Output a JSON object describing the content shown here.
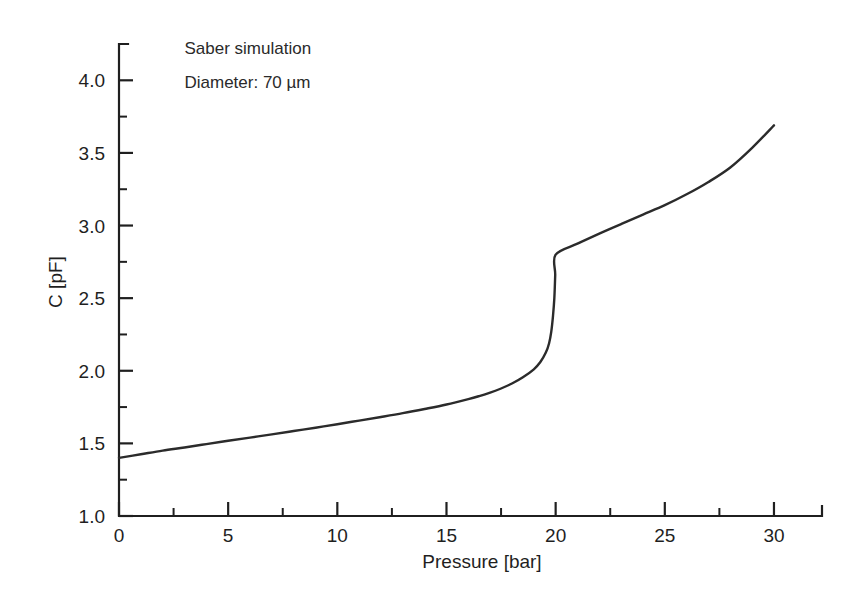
{
  "chart_data": {
    "type": "line",
    "title": "",
    "xlabel": "Pressure [bar]",
    "ylabel": "C [pF]",
    "xlim": [
      0,
      32.2
    ],
    "ylim": [
      1.0,
      4.25
    ],
    "grid": false,
    "legend": null,
    "annotations": [
      {
        "text": "Saber simulation",
        "x": 3.0,
        "y": 4.18
      },
      {
        "text": "Diameter: 70 µm",
        "x": 3.0,
        "y": 3.95
      }
    ],
    "xticks": [
      0,
      5,
      10,
      15,
      20,
      25,
      30
    ],
    "xtick_labels": [
      "0",
      "5",
      "10",
      "15",
      "20",
      "25",
      "30"
    ],
    "xticks_minor": [
      2.5,
      7.5,
      12.5,
      17.5,
      22.5,
      27.5
    ],
    "yticks": [
      1.0,
      1.5,
      2.0,
      2.5,
      3.0,
      3.5,
      4.0
    ],
    "ytick_labels": [
      "1.0",
      "1.5",
      "2.0",
      "2.5",
      "3.0",
      "3.5",
      "4.0"
    ],
    "yticks_minor": [
      1.25,
      1.75,
      2.25,
      2.75,
      3.25,
      3.75,
      4.25
    ],
    "series": [
      {
        "name": "Saber simulation, 70 µm diameter",
        "color": "#2b2b2b",
        "x": [
          0.0,
          1.0,
          2.0,
          3.0,
          4.0,
          5.0,
          6.0,
          7.0,
          8.0,
          9.0,
          10.0,
          11.0,
          12.0,
          13.0,
          14.0,
          15.0,
          16.0,
          16.5,
          17.0,
          17.5,
          18.0,
          18.5,
          19.0,
          19.3,
          19.55,
          19.7,
          19.8,
          19.88,
          19.94,
          19.98,
          20.0,
          21.0,
          22.0,
          23.0,
          24.0,
          25.0,
          26.0,
          27.0,
          28.0,
          29.0,
          30.0
        ],
        "y": [
          1.4,
          1.425,
          1.45,
          1.472,
          1.495,
          1.518,
          1.54,
          1.562,
          1.585,
          1.608,
          1.632,
          1.657,
          1.682,
          1.708,
          1.737,
          1.768,
          1.805,
          1.826,
          1.85,
          1.878,
          1.912,
          1.955,
          2.01,
          2.06,
          2.125,
          2.19,
          2.27,
          2.38,
          2.5,
          2.66,
          2.8,
          2.875,
          2.945,
          3.01,
          3.075,
          3.14,
          3.215,
          3.3,
          3.4,
          3.535,
          3.69
        ]
      }
    ]
  }
}
